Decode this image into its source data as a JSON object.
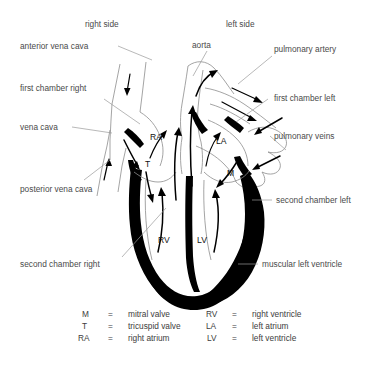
{
  "diagram": {
    "side_labels": {
      "right": "right side",
      "left": "left side"
    },
    "left_callouts": [
      {
        "id": "anterior-vena-cava",
        "text": "anterior vena cava"
      },
      {
        "id": "first-chamber-right",
        "text": "first chamber right"
      },
      {
        "id": "vena-cava",
        "text": "vena cava"
      },
      {
        "id": "posterior-vena-cava",
        "text": "posterior vena cava"
      },
      {
        "id": "second-chamber-right",
        "text": "second chamber right"
      }
    ],
    "top_callouts": [
      {
        "id": "aorta",
        "text": "aorta"
      }
    ],
    "right_callouts": [
      {
        "id": "pulmonary-artery",
        "text": "pulmonary artery"
      },
      {
        "id": "first-chamber-left",
        "text": "first chamber left"
      },
      {
        "id": "pulmonary-veins",
        "text": "pulmonary veins"
      },
      {
        "id": "second-chamber-left",
        "text": "second chamber left"
      },
      {
        "id": "muscular-left-ventricle",
        "text": "muscular left ventricle"
      }
    ],
    "inner_labels": [
      {
        "id": "ra",
        "text": "RA"
      },
      {
        "id": "la",
        "text": "LA"
      },
      {
        "id": "t",
        "text": "T"
      },
      {
        "id": "m",
        "text": "M"
      },
      {
        "id": "rv",
        "text": "RV"
      },
      {
        "id": "lv",
        "text": "LV"
      }
    ]
  },
  "legend": {
    "equals": "=",
    "left_column": [
      {
        "abbr": "M",
        "term": "mitral valve"
      },
      {
        "abbr": "T",
        "term": "tricuspid valve"
      },
      {
        "abbr": "RA",
        "term": "right atrium"
      }
    ],
    "right_column": [
      {
        "abbr": "RV",
        "term": "right ventricle"
      },
      {
        "abbr": "LA",
        "term": "left atrium"
      },
      {
        "abbr": "LV",
        "term": "left ventricle"
      }
    ]
  },
  "colors": {
    "background": "#ffffff",
    "muscle": "#000000",
    "vessel_outline": "#8d8d8d",
    "label_text": "#4a4a4a",
    "leader_line": "#9a9a9a"
  }
}
